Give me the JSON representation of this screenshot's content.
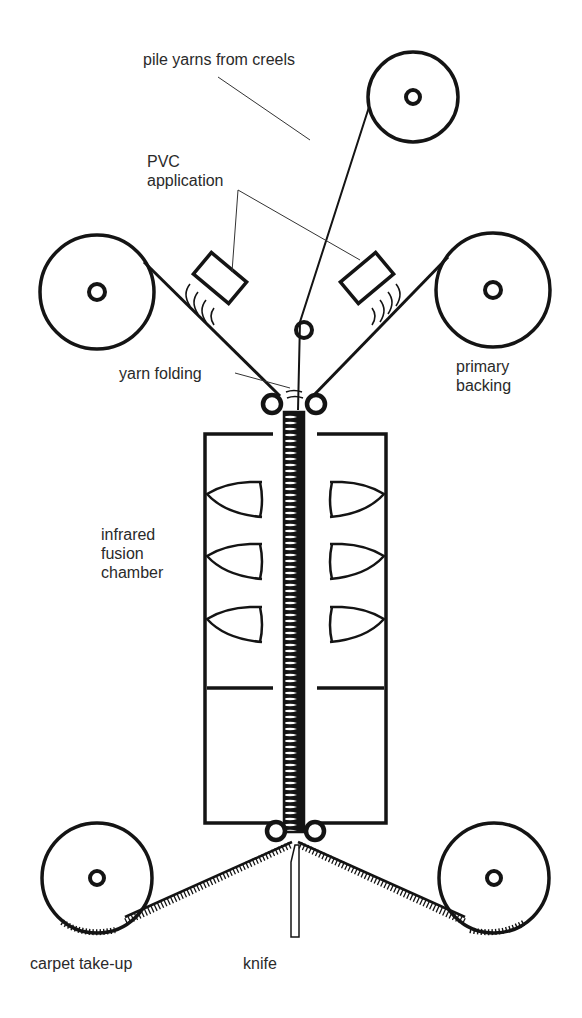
{
  "diagram": {
    "type": "process-schematic",
    "colors": {
      "ink": "#141414",
      "background": "#ffffff",
      "label": "#2a2a2a"
    },
    "labels": {
      "pile_yarns": "pile yarns from creels",
      "pvc_line1": "PVC",
      "pvc_line2": "application",
      "yarn_folding": "yarn folding",
      "primary_line1": "primary",
      "primary_line2": "backing",
      "infrared_line1": "infrared",
      "infrared_line2": "fusion",
      "infrared_line3": "chamber",
      "carpet_takeup": "carpet take-up",
      "knife": "knife"
    },
    "components": [
      {
        "id": "creel-roll",
        "label": "pile yarns from creels"
      },
      {
        "id": "backing-roll-left",
        "label": "primary backing"
      },
      {
        "id": "backing-roll-right",
        "label": "primary backing"
      },
      {
        "id": "pvc-applicator-left",
        "label": "PVC application"
      },
      {
        "id": "pvc-applicator-right",
        "label": "PVC application"
      },
      {
        "id": "guide-roller",
        "label": ""
      },
      {
        "id": "nip-rollers-top",
        "label": "yarn folding"
      },
      {
        "id": "fusion-chamber",
        "label": "infrared fusion chamber",
        "heaters_per_side": 3
      },
      {
        "id": "nip-rollers-bottom",
        "label": ""
      },
      {
        "id": "knife",
        "label": "knife"
      },
      {
        "id": "takeup-roll-left",
        "label": "carpet take-up"
      },
      {
        "id": "takeup-roll-right",
        "label": "carpet take-up"
      }
    ]
  }
}
